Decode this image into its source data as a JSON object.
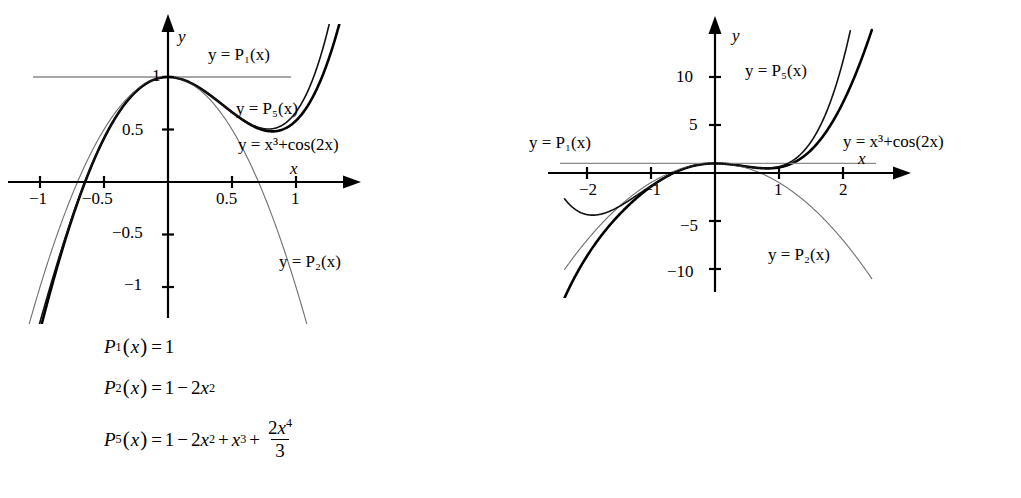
{
  "figure": {
    "background_color": "#ffffff",
    "curve_colors": {
      "function": "#000000",
      "p1": "#8a8a8a",
      "p2": "#6f6f6f",
      "p5": "#111111"
    }
  },
  "panels": [
    {
      "id": "left",
      "axes": {
        "x_axis_label": "x",
        "y_axis_label": "y",
        "xlim": [
          -1.28,
          1.35
        ],
        "ylim": [
          -1.45,
          1.32
        ],
        "x_ticks": [
          {
            "value": -1,
            "label": "−1"
          },
          {
            "value": -0.5,
            "label": "−0.5"
          },
          {
            "value": 0.5,
            "label": "0.5"
          },
          {
            "value": 1,
            "label": "1"
          }
        ],
        "y_ticks": [
          {
            "value": 1,
            "label": "1"
          },
          {
            "value": 0.5,
            "label": "0.5"
          },
          {
            "value": -0.5,
            "label": "−0.5"
          },
          {
            "value": -1,
            "label": "−1"
          }
        ]
      },
      "labels": {
        "p1": "y = P₁(x)",
        "p5": "y = P₅(x)",
        "p2": "y = P₂(x)",
        "fn": "y = x³+cos(2x)"
      }
    },
    {
      "id": "right",
      "axes": {
        "x_axis_label": "x",
        "y_axis_label": "y",
        "xlim": [
          -2.35,
          2.45
        ],
        "ylim": [
          -13.5,
          13.0
        ],
        "x_ticks": [
          {
            "value": -2,
            "label": "−2"
          },
          {
            "value": -1,
            "label": "−1"
          },
          {
            "value": 1,
            "label": "1"
          },
          {
            "value": 2,
            "label": "2"
          }
        ],
        "y_ticks": [
          {
            "value": 10,
            "label": "10"
          },
          {
            "value": 5,
            "label": "5"
          },
          {
            "value": -5,
            "label": "−5"
          },
          {
            "value": -10,
            "label": "−10"
          }
        ]
      },
      "labels": {
        "p1": "y = P₁(x)",
        "p5": "y = P₅(x)",
        "p2": "y = P₂(x)",
        "fn": "y = x³+cos(2x)"
      }
    }
  ],
  "chart_data": {
    "type": "line",
    "title": "",
    "xlabel": "x",
    "ylabel": "y",
    "grid": false,
    "legend_position": "inline-annotations",
    "function_expression": "y = x^3 + cos(2x)",
    "series": [
      {
        "name": "y = x^3+cos(2x)",
        "expression": "x^3 + cos(2*x)",
        "color": "#000000",
        "style": "thick-solid"
      },
      {
        "name": "y = P1(x)",
        "expression": "1",
        "color": "#8a8a8a",
        "style": "thin-solid"
      },
      {
        "name": "y = P2(x)",
        "expression": "1 - 2*x^2",
        "color": "#6f6f6f",
        "style": "thin-solid"
      },
      {
        "name": "y = P5(x)",
        "expression": "1 - 2*x^2 + x^3 + (2/3)*x^4",
        "color": "#111111",
        "style": "medium-solid"
      }
    ],
    "panels": [
      {
        "id": "left",
        "xlim": [
          -1.28,
          1.35
        ],
        "ylim": [
          -1.45,
          1.32
        ],
        "x_ticks": [
          -1,
          -0.5,
          0.5,
          1
        ],
        "y_ticks": [
          1,
          0.5,
          -0.5,
          -1
        ]
      },
      {
        "id": "right",
        "xlim": [
          -2.35,
          2.45
        ],
        "ylim": [
          -13.5,
          13.0
        ],
        "x_ticks": [
          -2,
          -1,
          1,
          2
        ],
        "y_ticks": [
          10,
          5,
          -5,
          -10
        ]
      }
    ]
  },
  "formulas": {
    "p1": {
      "name": "P",
      "sub": "1",
      "var": "x",
      "eq": "=",
      "rhs_const": "1"
    },
    "p2": {
      "name": "P",
      "sub": "2",
      "var": "x",
      "eq": "=",
      "one": "1",
      "minus": "−",
      "coef2": "2",
      "x2": "x",
      "pow2": "2"
    },
    "p5": {
      "name": "P",
      "sub": "5",
      "var": "x",
      "eq": "=",
      "one": "1",
      "minus": "−",
      "coef2": "2",
      "x2": "x",
      "pow2": "2",
      "plus1": "+",
      "x3": "x",
      "pow3": "3",
      "plus2": "+",
      "frac_num_coef": "2",
      "frac_num_var": "x",
      "frac_num_pow": "4",
      "frac_den": "3"
    }
  }
}
